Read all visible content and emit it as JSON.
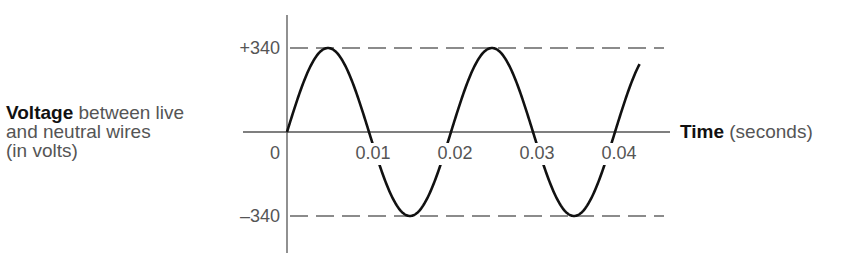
{
  "y_axis": {
    "label_bold": "Voltage",
    "label_rest_line1": " between live",
    "label_line2": "and neutral wires",
    "label_line3": "(in volts)"
  },
  "x_axis": {
    "label_bold": "Time",
    "label_rest": " (seconds)"
  },
  "chart_data": {
    "type": "line",
    "title": "",
    "xlabel": "Time (seconds)",
    "ylabel": "Voltage between live and neutral wires (in volts)",
    "x_ticks": [
      "0",
      "0.01",
      "0.02",
      "0.03",
      "0.04"
    ],
    "y_ticks": [
      "+340",
      "-340"
    ],
    "reference_lines": [
      340,
      -340
    ],
    "function": "340*sin(2*pi*50*t)",
    "amplitude": 340,
    "frequency_hz": 50,
    "x_range": [
      0,
      0.043
    ],
    "ylim": [
      -340,
      340
    ],
    "x": [
      0,
      0.005,
      0.01,
      0.015,
      0.02,
      0.025,
      0.03,
      0.035,
      0.04
    ],
    "values": [
      0,
      340,
      0,
      -340,
      0,
      340,
      0,
      -340,
      0
    ]
  }
}
